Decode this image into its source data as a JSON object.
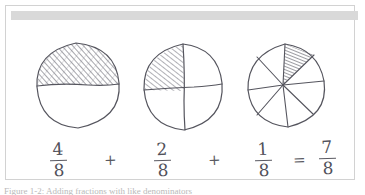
{
  "figure": {
    "caption": "Figure 1-2: Adding fractions with like denominators",
    "header_band_color": "#d9d9d9",
    "card_border_color": "#d2d2d2",
    "background_color": "#ffffff",
    "ink_color": "#51515a"
  },
  "diagrams": [
    {
      "name": "circle-four-eighths",
      "label": "circle divided in half, top half shaded",
      "total_parts": 2,
      "shaded_parts": 1,
      "represents": "4/8"
    },
    {
      "name": "circle-two-eighths",
      "label": "circle divided into quarters, top-left quarter shaded",
      "total_parts": 4,
      "shaded_parts": 1,
      "represents": "2/8"
    },
    {
      "name": "circle-one-eighth",
      "label": "circle divided into eighths, one wedge shaded",
      "total_parts": 8,
      "shaded_parts": 1,
      "represents": "1/8"
    }
  ],
  "equation": {
    "terms": [
      {
        "numerator": "4",
        "denominator": "8"
      },
      {
        "numerator": "2",
        "denominator": "8"
      },
      {
        "numerator": "1",
        "denominator": "8"
      },
      {
        "numerator": "7",
        "denominator": "8"
      }
    ],
    "operators": {
      "plus_1": "+",
      "plus_2": "+",
      "equals": "="
    },
    "full_text": "4/8 + 2/8 + 1/8 = 7/8"
  }
}
